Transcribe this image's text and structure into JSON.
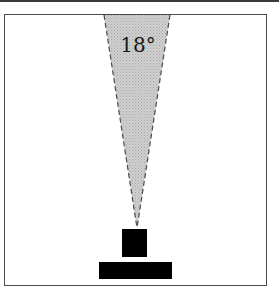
{
  "diagram": {
    "type": "field-of-view",
    "angle_label": "18°",
    "colors": {
      "cone_fill": "#c4c4c4",
      "cone_edge": "#4a4a4a",
      "device": "#000000",
      "frame_border": "#4a4a4a"
    }
  }
}
